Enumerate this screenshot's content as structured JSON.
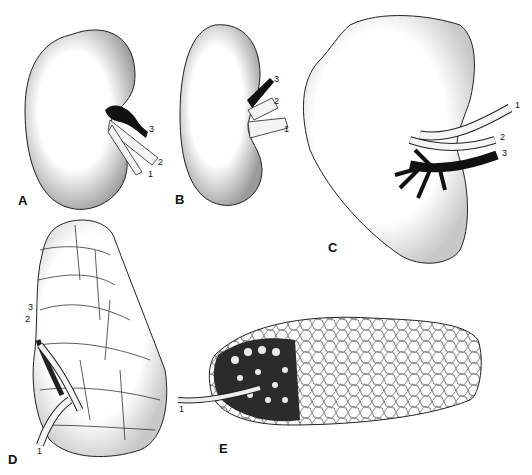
{
  "figure": {
    "panels": [
      {
        "id": "A",
        "label": "A",
        "description": "bean-shaped kidney",
        "vessel_labels": [
          "1",
          "2",
          "3"
        ]
      },
      {
        "id": "B",
        "label": "B",
        "description": "elongated kidney",
        "vessel_labels": [
          "1",
          "2",
          "3"
        ]
      },
      {
        "id": "C",
        "label": "C",
        "description": "lobed kidney with branching vessels",
        "vessel_labels": [
          "1",
          "2",
          "3"
        ]
      },
      {
        "id": "D",
        "label": "D",
        "description": "multilobed (reniculate) kidney",
        "vessel_labels": [
          "1",
          "2",
          "3"
        ]
      },
      {
        "id": "E",
        "label": "E",
        "description": "elongated reniculate kidney with cut-away section",
        "vessel_labels": [
          "1"
        ]
      }
    ]
  }
}
